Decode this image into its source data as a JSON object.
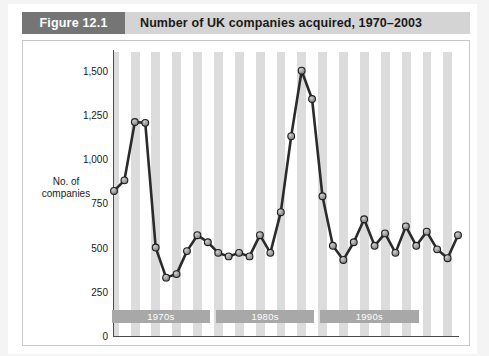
{
  "figure": {
    "tag_label": "Figure 12.1",
    "title": "Number of UK companies acquired, 1970–2003"
  },
  "axis": {
    "y_title_line1": "No. of",
    "y_title_line2": "companies",
    "y_ticks": [
      "0",
      "250",
      "500",
      "750",
      "1,000",
      "1,250",
      "1,500"
    ]
  },
  "decades": [
    {
      "label": "1970s"
    },
    {
      "label": "1980s"
    },
    {
      "label": "1990s"
    }
  ],
  "colors": {
    "tag_bg": "#757575",
    "header_bg": "#d4d4d4",
    "band": "#dcdcdc",
    "decade_bar": "#a8a8a8",
    "line": "#2b2b2b",
    "marker_fill": "#8f8f8f",
    "marker_stroke": "#1f1f1f",
    "page_bg": "#f4f4f4",
    "card_bg": "#ffffff"
  },
  "chart_data": {
    "type": "line",
    "title": "Number of UK companies acquired, 1970–2003",
    "xlabel": "",
    "ylabel": "No. of companies",
    "ylim": [
      0,
      1600
    ],
    "yticks": [
      0,
      250,
      500,
      750,
      1000,
      1250,
      1500
    ],
    "grid": false,
    "legend": "none",
    "x": [
      1970,
      1971,
      1972,
      1973,
      1974,
      1975,
      1976,
      1977,
      1978,
      1979,
      1980,
      1981,
      1982,
      1983,
      1984,
      1985,
      1986,
      1987,
      1988,
      1989,
      1990,
      1991,
      1992,
      1993,
      1994,
      1995,
      1996,
      1997,
      1998,
      1999,
      2000,
      2001,
      2002,
      2003
    ],
    "values": [
      820,
      880,
      1210,
      1205,
      500,
      330,
      350,
      480,
      570,
      530,
      470,
      450,
      470,
      450,
      570,
      470,
      700,
      1130,
      1500,
      1340,
      790,
      510,
      430,
      530,
      660,
      510,
      580,
      470,
      620,
      510,
      590,
      490,
      440,
      570
    ],
    "series": [
      {
        "name": "UK companies acquired",
        "values": [
          820,
          880,
          1210,
          1205,
          500,
          330,
          350,
          480,
          570,
          530,
          470,
          450,
          470,
          450,
          570,
          470,
          700,
          1130,
          1500,
          1340,
          790,
          510,
          430,
          530,
          660,
          510,
          580,
          470,
          620,
          510,
          590,
          490,
          440,
          570
        ]
      }
    ],
    "annotations": [
      "1970s",
      "1980s",
      "1990s"
    ]
  }
}
